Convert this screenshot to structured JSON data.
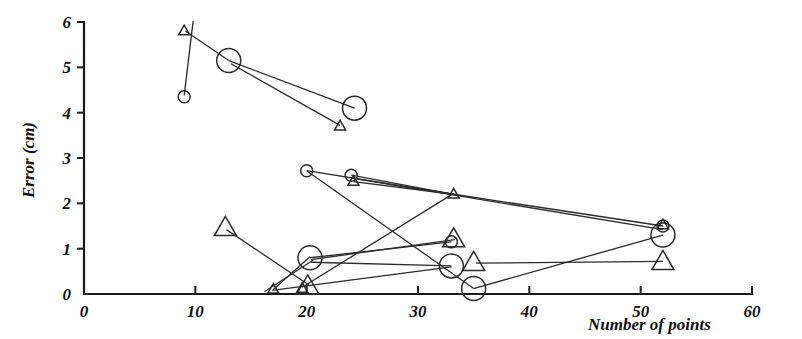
{
  "figure": {
    "name": "error-vs-number-of-points-scatter",
    "background_color": "#ffffff",
    "ink_color": "#1a1a1a",
    "width": 802,
    "height": 339
  },
  "axes": {
    "x": {
      "title": "Number of points",
      "ticks": [
        "0",
        "10",
        "20",
        "30",
        "40",
        "50",
        "60"
      ],
      "tick_values": [
        0,
        10,
        20,
        30,
        40,
        50,
        60
      ],
      "min": 0,
      "max": 60
    },
    "y": {
      "title": "Error (cm)",
      "ticks": [
        "0",
        "1",
        "2",
        "3",
        "4",
        "5",
        "6"
      ],
      "tick_values": [
        0,
        1,
        2,
        3,
        4,
        5,
        6
      ],
      "min": 0,
      "max": 6
    }
  },
  "chart_data": {
    "type": "scatter",
    "title": "",
    "xlabel": "Number of points",
    "ylabel": "Error (cm)",
    "xlim": [
      0,
      60
    ],
    "ylim": [
      0,
      6
    ],
    "xticks": [
      0,
      10,
      20,
      30,
      40,
      50,
      60
    ],
    "yticks": [
      0,
      1,
      2,
      3,
      4,
      5,
      6
    ],
    "grid": false,
    "legend": "none",
    "marker_kinds": [
      {
        "key": "small-circle",
        "shape": "circle",
        "size": "small"
      },
      {
        "key": "large-circle",
        "shape": "circle",
        "size": "large"
      },
      {
        "key": "small-triangle",
        "shape": "triangle",
        "size": "small"
      },
      {
        "key": "large-triangle",
        "shape": "triangle",
        "size": "large"
      }
    ],
    "series": [
      {
        "name": "small-circle",
        "marker": "small-circle",
        "points": [
          {
            "x": 9.0,
            "y": 4.35
          },
          {
            "x": 20.0,
            "y": 2.72
          },
          {
            "x": 24.0,
            "y": 2.62
          },
          {
            "x": 33.0,
            "y": 1.15
          },
          {
            "x": 52.0,
            "y": 1.5
          }
        ]
      },
      {
        "name": "large-circle",
        "marker": "large-circle",
        "points": [
          {
            "x": 13.0,
            "y": 5.15
          },
          {
            "x": 24.3,
            "y": 4.1
          },
          {
            "x": 20.3,
            "y": 0.8
          },
          {
            "x": 33.0,
            "y": 0.62
          },
          {
            "x": 35.0,
            "y": 0.12
          },
          {
            "x": 52.0,
            "y": 1.3
          }
        ]
      },
      {
        "name": "small-triangle",
        "marker": "small-triangle",
        "points": [
          {
            "x": 9.0,
            "y": 5.8
          },
          {
            "x": 23.0,
            "y": 3.7
          },
          {
            "x": 24.2,
            "y": 2.48
          },
          {
            "x": 33.2,
            "y": 2.2
          },
          {
            "x": 17.0,
            "y": 0.1
          },
          {
            "x": 19.6,
            "y": 0.12
          },
          {
            "x": 52.0,
            "y": 1.52
          }
        ]
      },
      {
        "name": "large-triangle",
        "marker": "large-triangle",
        "points": [
          {
            "x": 12.7,
            "y": 1.45
          },
          {
            "x": 20.1,
            "y": 0.16
          },
          {
            "x": 33.2,
            "y": 1.2
          },
          {
            "x": 35.0,
            "y": 0.68
          },
          {
            "x": 52.0,
            "y": 0.7
          }
        ]
      }
    ],
    "connections": [
      {
        "name": "segment-topleft-triangle-to-circle",
        "from": {
          "x": 9.8,
          "y": 6.02
        },
        "to": {
          "x": 9.0,
          "y": 4.38
        }
      },
      {
        "name": "segment-triangle9-to-circle13",
        "from": {
          "x": 9.1,
          "y": 5.8
        },
        "to": {
          "x": 13.0,
          "y": 5.15
        }
      },
      {
        "name": "segment-circle13-to-circle24",
        "from": {
          "x": 13.0,
          "y": 5.15
        },
        "to": {
          "x": 24.3,
          "y": 4.1
        }
      },
      {
        "name": "segment-circle13-to-triangle23",
        "from": {
          "x": 13.2,
          "y": 5.08
        },
        "to": {
          "x": 23.0,
          "y": 3.72
        }
      },
      {
        "name": "segment-smallcircle20-to-triangle33",
        "from": {
          "x": 20.0,
          "y": 2.72
        },
        "to": {
          "x": 33.2,
          "y": 2.2
        }
      },
      {
        "name": "segment-smallcircle24-to-triangle33",
        "from": {
          "x": 24.0,
          "y": 2.62
        },
        "to": {
          "x": 33.2,
          "y": 2.2
        }
      },
      {
        "name": "segment-smalltriangle24-to-triangle33",
        "from": {
          "x": 24.2,
          "y": 2.48
        },
        "to": {
          "x": 33.2,
          "y": 2.2
        }
      },
      {
        "name": "segment-triangle33-to-cluster52",
        "from": {
          "x": 33.2,
          "y": 2.2
        },
        "to": {
          "x": 52.0,
          "y": 1.5
        }
      },
      {
        "name": "segment-smallcircle24-to-cluster52",
        "from": {
          "x": 24.2,
          "y": 2.55
        },
        "to": {
          "x": 52.0,
          "y": 1.42
        }
      },
      {
        "name": "segment-smallcircle20-down-to-bottom",
        "from": {
          "x": 20.0,
          "y": 2.72
        },
        "to": {
          "x": 35.0,
          "y": 0.12
        }
      },
      {
        "name": "segment-bottom35-to-cluster52",
        "from": {
          "x": 35.0,
          "y": 0.12
        },
        "to": {
          "x": 52.0,
          "y": 1.3
        }
      },
      {
        "name": "segment-cluster20-to-triangle33",
        "from": {
          "x": 19.6,
          "y": 0.15
        },
        "to": {
          "x": 33.2,
          "y": 2.22
        }
      },
      {
        "name": "segment-bigtriangle13-to-cluster20",
        "from": {
          "x": 12.8,
          "y": 1.42
        },
        "to": {
          "x": 20.2,
          "y": 0.2
        }
      },
      {
        "name": "segment-smalltriangle17-to-circle20",
        "from": {
          "x": 17.0,
          "y": 0.1
        },
        "to": {
          "x": 20.3,
          "y": 0.82
        }
      },
      {
        "name": "segment-circle20-to-smallcircle33",
        "from": {
          "x": 20.3,
          "y": 0.8
        },
        "to": {
          "x": 33.0,
          "y": 1.15
        }
      },
      {
        "name": "segment-circle20-to-bigtriangle33",
        "from": {
          "x": 20.4,
          "y": 0.76
        },
        "to": {
          "x": 33.3,
          "y": 1.2
        }
      },
      {
        "name": "segment-circle20-to-circle33",
        "from": {
          "x": 20.4,
          "y": 0.7
        },
        "to": {
          "x": 33.0,
          "y": 0.62
        }
      },
      {
        "name": "segment-bigtriangle35-to-cluster52",
        "from": {
          "x": 35.2,
          "y": 0.68
        },
        "to": {
          "x": 52.0,
          "y": 0.72
        }
      },
      {
        "name": "segment-smalltriangle17-to-circle33",
        "from": {
          "x": 16.9,
          "y": 0.08
        },
        "to": {
          "x": 33.0,
          "y": 0.6
        }
      },
      {
        "name": "segment-left-baseline-to-cluster20",
        "from": {
          "x": 16.2,
          "y": 0.05
        },
        "to": {
          "x": 20.6,
          "y": 0.75
        }
      }
    ]
  }
}
